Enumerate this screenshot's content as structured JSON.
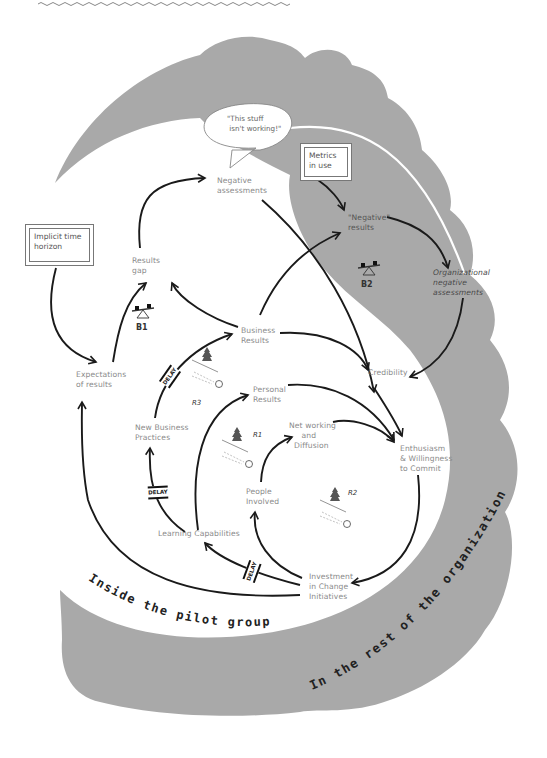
{
  "diagram": {
    "type": "causal-loop-diagram",
    "regions": {
      "inner": "Inside the pilot group",
      "outer": "In the rest of the organization"
    },
    "exogenous_boxes": {
      "implicit_time_horizon": "Implicit time\nhorizon",
      "metrics_in_use": "Metrics\nin use"
    },
    "speech_bubble": "\"This stuff\n isn't working!\"",
    "variables": {
      "negative_assessments": "Negative\nassessments",
      "results_gap": "Results\ngap",
      "expectations_of_results": "Expectations\nof results",
      "business_results": "Business\nResults",
      "personal_results": "Personal\nResults",
      "new_business_practices": "New Business\nPractices",
      "networking_and_diffusion": "Net working\n     and\n  Diffusion",
      "people_involved": "People\nInvolved",
      "learning_capabilities": "Learning Capabilities",
      "investment_in_change_initiatives": "Investment\nin Change\nInitiatives",
      "credibility": "Credibility",
      "enthusiasm_willingness": "Enthusiasm\n& Willingness\nto Commit",
      "negative_results": "\"Negative\"\nresults",
      "organizational_negative_assessments": "Organizational\nnegative\nassessments"
    },
    "loops": {
      "b1": "B1",
      "b2": "B2",
      "r1": "R1",
      "r2": "R2",
      "r3": "R3"
    },
    "delay_label": "DELAY",
    "colors": {
      "outer_region": "#a9a9a9",
      "inner_region": "#ffffff",
      "arrow": "#1a1a1a",
      "label": "#8a8a8a"
    }
  }
}
